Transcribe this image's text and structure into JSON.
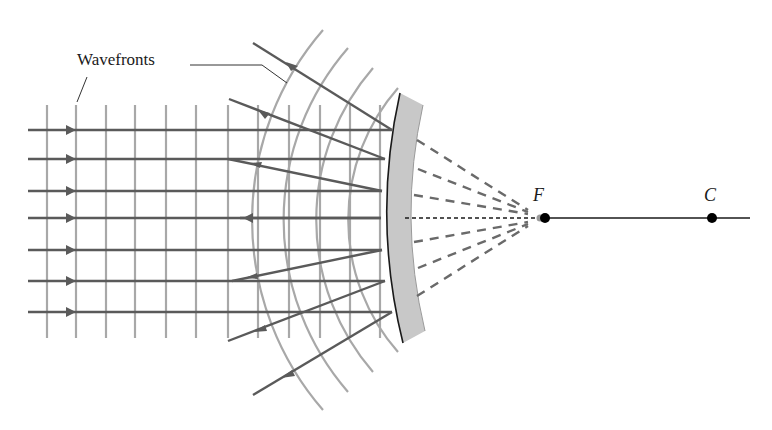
{
  "diagram": {
    "labels": {
      "wavefronts": "Wavefronts",
      "focal_point": "F",
      "center_of_curvature": "C"
    },
    "colors": {
      "ray": "#5a5a5a",
      "wavefront": "#a8a8a8",
      "mirror_fill": "#c8c8c8",
      "mirror_edge": "#1a1a1a",
      "axis": "#1a1a1a",
      "point": "#000000"
    },
    "incoming_rays_y": [
      130,
      159,
      191,
      218,
      250,
      281,
      312
    ],
    "plane_wavefronts_x": [
      47,
      76,
      106,
      135,
      166,
      196,
      228,
      258,
      289,
      320,
      350,
      380
    ],
    "points": {
      "F": {
        "x": 545,
        "y": 218
      },
      "C": {
        "x": 712,
        "y": 218
      }
    }
  }
}
